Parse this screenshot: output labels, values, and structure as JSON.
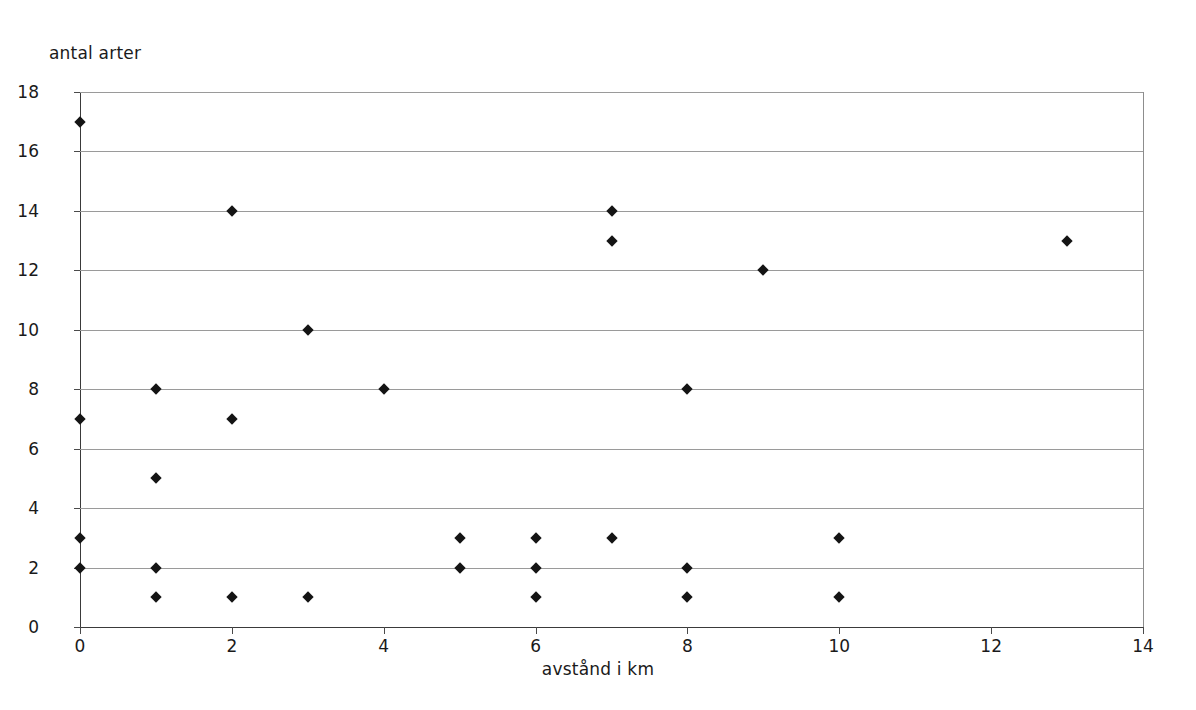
{
  "chart_data": {
    "type": "scatter",
    "title": "",
    "xlabel": "avstånd i km",
    "ylabel": "antal arter",
    "xlim": [
      0,
      14
    ],
    "ylim": [
      0,
      18
    ],
    "xticks": [
      0,
      2,
      4,
      6,
      8,
      10,
      12,
      14
    ],
    "yticks": [
      0,
      2,
      4,
      6,
      8,
      10,
      12,
      14,
      16,
      18
    ],
    "xtick_labels": [
      "0",
      "2",
      "4",
      "6",
      "8",
      "10",
      "12",
      "14"
    ],
    "ytick_labels": [
      "0",
      "2",
      "4",
      "6",
      "8",
      "10",
      "12",
      "14",
      "16",
      "18"
    ],
    "grid": "horizontal",
    "legend": "none",
    "marker": "diamond",
    "marker_color": "#141414",
    "gridline_color": "#9a9a9a",
    "axis_color": "#3a3a3a",
    "background": "#ffffff",
    "points": [
      {
        "x": 0,
        "y": 17
      },
      {
        "x": 0,
        "y": 7
      },
      {
        "x": 0,
        "y": 3
      },
      {
        "x": 0,
        "y": 2
      },
      {
        "x": 1,
        "y": 8
      },
      {
        "x": 1,
        "y": 5
      },
      {
        "x": 1,
        "y": 2
      },
      {
        "x": 1,
        "y": 1
      },
      {
        "x": 2,
        "y": 14
      },
      {
        "x": 2,
        "y": 7
      },
      {
        "x": 2,
        "y": 1
      },
      {
        "x": 3,
        "y": 10
      },
      {
        "x": 3,
        "y": 1
      },
      {
        "x": 4,
        "y": 8
      },
      {
        "x": 5,
        "y": 3
      },
      {
        "x": 5,
        "y": 2
      },
      {
        "x": 6,
        "y": 3
      },
      {
        "x": 6,
        "y": 2
      },
      {
        "x": 6,
        "y": 1
      },
      {
        "x": 7,
        "y": 14
      },
      {
        "x": 7,
        "y": 13
      },
      {
        "x": 7,
        "y": 3
      },
      {
        "x": 8,
        "y": 8
      },
      {
        "x": 8,
        "y": 2
      },
      {
        "x": 8,
        "y": 1
      },
      {
        "x": 9,
        "y": 12
      },
      {
        "x": 10,
        "y": 3
      },
      {
        "x": 10,
        "y": 1
      },
      {
        "x": 13,
        "y": 13
      }
    ]
  }
}
